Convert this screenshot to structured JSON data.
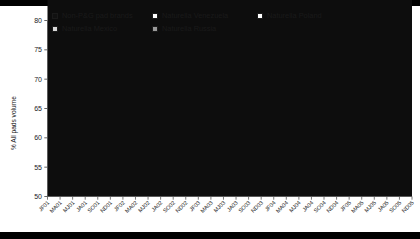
{
  "legend": {
    "rows": [
      [
        {
          "label": "Non-P&G pad brands",
          "swatch": "black",
          "icon": "legend-swatch-icon"
        },
        {
          "label": "Naturella Venezuela",
          "swatch": "white",
          "icon": "legend-swatch-icon"
        },
        {
          "label": "Naturella Poland",
          "swatch": "white",
          "icon": "legend-swatch-icon"
        }
      ],
      [
        {
          "label": "Naturella Mexico",
          "swatch": "lightgray",
          "icon": "legend-swatch-icon"
        },
        {
          "label": "Naturella Russia",
          "swatch": "midgray",
          "icon": "legend-swatch-icon"
        }
      ]
    ]
  },
  "axis": {
    "y_title": "% All pads volume",
    "y_ticks": [
      "80",
      "75",
      "70",
      "65",
      "60",
      "55",
      "50"
    ]
  },
  "colors": {
    "non_pg": "#0d0d0d",
    "mexico": "#d4d4d4",
    "venezuela": "#ffffff",
    "russia": "#969696",
    "poland": "#ffffff",
    "axis": "#555555",
    "outline": "#4d4d4d",
    "text": "#1a1a1a"
  },
  "chart_data": {
    "type": "area",
    "stacked": true,
    "title": "",
    "xlabel": "",
    "ylabel": "% All pads volume",
    "ylim": [
      50,
      80
    ],
    "ytick_values": [
      50,
      55,
      60,
      65,
      70,
      75,
      80
    ],
    "grid": false,
    "legend_position": "top",
    "baseline": 50,
    "x": [
      "JF01",
      "MA01",
      "MJ01",
      "JA01",
      "SO01",
      "ND01",
      "JF02",
      "MA02",
      "MJ02",
      "JA02",
      "SO02",
      "ND02",
      "JF03",
      "MA03",
      "MJ03",
      "JA03",
      "SO03",
      "ND03",
      "JF04",
      "MA04",
      "MJ04",
      "JA04",
      "SO04",
      "ND04",
      "JF05",
      "MA05",
      "MJ05",
      "JA05",
      "SO05",
      "ND05"
    ],
    "series": [
      {
        "name": "Non-P&G pad brands",
        "color": "#0d0d0d",
        "values": [
          75.6,
          75.3,
          75.9,
          75.4,
          75.8,
          75.3,
          75.6,
          75.2,
          75.4,
          74.9,
          74.6,
          74.1,
          73.8,
          73.3,
          72.6,
          72.0,
          71.3,
          70.6,
          70.0,
          69.2,
          68.5,
          67.8,
          67.0,
          66.4,
          65.8,
          65.2,
          64.7,
          64.2,
          63.7,
          63.3
        ]
      },
      {
        "name": "Naturella Mexico",
        "color": "#d4d4d4",
        "values": [
          0.4,
          0.5,
          0.4,
          0.6,
          0.5,
          0.7,
          0.6,
          0.8,
          0.9,
          1.2,
          1.5,
          1.9,
          2.2,
          2.6,
          3.1,
          3.6,
          4.0,
          4.4,
          4.7,
          5.0,
          5.1,
          5.2,
          5.2,
          5.0,
          4.8,
          4.6,
          4.5,
          4.3,
          4.2,
          4.1
        ]
      },
      {
        "name": "Naturella Venezuela",
        "color": "#ffffff",
        "values": [
          0,
          0,
          0,
          0,
          0,
          0,
          0,
          0,
          0,
          0,
          0,
          0,
          0,
          0,
          0,
          0,
          0,
          0,
          0.2,
          0.4,
          0.5,
          0.5,
          0.5,
          0.5,
          0.5,
          0.5,
          0.5,
          0.5,
          0.5,
          0.5
        ]
      },
      {
        "name": "Naturella Russia",
        "color": "#969696",
        "values": [
          0,
          0,
          0,
          0,
          0,
          0,
          0,
          0,
          0,
          0,
          0,
          0,
          0,
          0,
          0,
          0,
          0,
          0,
          0.3,
          1.1,
          1.9,
          2.4,
          2.6,
          2.7,
          2.8,
          2.8,
          2.7,
          2.7,
          2.6,
          2.6
        ]
      },
      {
        "name": "Naturella Poland",
        "color": "#ffffff",
        "values": [
          0,
          0,
          0,
          0,
          0,
          0,
          0,
          0,
          0,
          0,
          0,
          0,
          0,
          0,
          0,
          0,
          0,
          0,
          0.2,
          0.8,
          1.4,
          1.6,
          1.5,
          1.7,
          1.5,
          1.8,
          1.6,
          1.8,
          1.6,
          1.7
        ]
      }
    ]
  }
}
